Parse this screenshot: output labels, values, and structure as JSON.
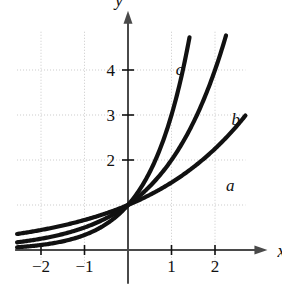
{
  "figure": {
    "background_color": "#ffffff",
    "ink_color": "#111111",
    "grid_color": "#c9c9c9",
    "axis_color": "#4a4a4a"
  },
  "axes": {
    "x_axis_label": "x",
    "y_axis_label": "y",
    "x_ticks": [
      "-2",
      "-1",
      "1",
      "2"
    ],
    "x_tick_values": [
      -2,
      -1,
      1,
      2
    ],
    "y_ticks": [
      "2",
      "3",
      "4"
    ],
    "y_tick_values": [
      2,
      3,
      4
    ],
    "x_range": [
      -2.55,
      2.7
    ],
    "y_range": [
      -0.35,
      4.85
    ],
    "grid": true
  },
  "curves": [
    {
      "label": "a",
      "base": 1.5,
      "label_x": 2.25,
      "label_y": 1.32
    },
    {
      "label": "b",
      "base": 2.0,
      "label_x": 2.38,
      "label_y": 2.78
    },
    {
      "label": "c",
      "base": 3.0,
      "label_x": 1.1,
      "label_y": 3.9
    }
  ],
  "chart_data": {
    "type": "line",
    "title": "",
    "xlabel": "x",
    "ylabel": "y",
    "xlim": [
      -2.55,
      2.7
    ],
    "ylim": [
      -0.35,
      4.85
    ],
    "grid": true,
    "legend": "inline curve labels a, b, c",
    "x_tick_labels": [
      "-2",
      "-1",
      "1",
      "2"
    ],
    "y_tick_labels": [
      "2",
      "3",
      "4"
    ],
    "annotations": [
      "a",
      "b",
      "c"
    ],
    "series": [
      {
        "name": "a",
        "formula": "y = 1.5^x",
        "x": [
          -2.5,
          -2,
          -1.5,
          -1,
          -0.5,
          0,
          0.5,
          1,
          1.5,
          2,
          2.45
        ],
        "values": [
          0.36,
          0.44,
          0.54,
          0.67,
          0.82,
          1.0,
          1.22,
          1.5,
          1.84,
          2.25,
          2.7
        ]
      },
      {
        "name": "b",
        "formula": "y = 2^x",
        "x": [
          -2.5,
          -2,
          -1.5,
          -1,
          -0.5,
          0,
          0.5,
          1,
          1.5,
          2,
          2.4
        ],
        "values": [
          0.18,
          0.25,
          0.35,
          0.5,
          0.71,
          1.0,
          1.41,
          2.0,
          2.83,
          4.0,
          3.45
        ]
      },
      {
        "name": "c",
        "formula": "y = 3^x",
        "x": [
          -2.5,
          -2,
          -1.5,
          -1,
          -0.5,
          0,
          0.5,
          1,
          1.43
        ],
        "values": [
          0.064,
          0.11,
          0.19,
          0.33,
          0.58,
          1.0,
          1.73,
          3.0,
          4.55
        ]
      }
    ]
  }
}
